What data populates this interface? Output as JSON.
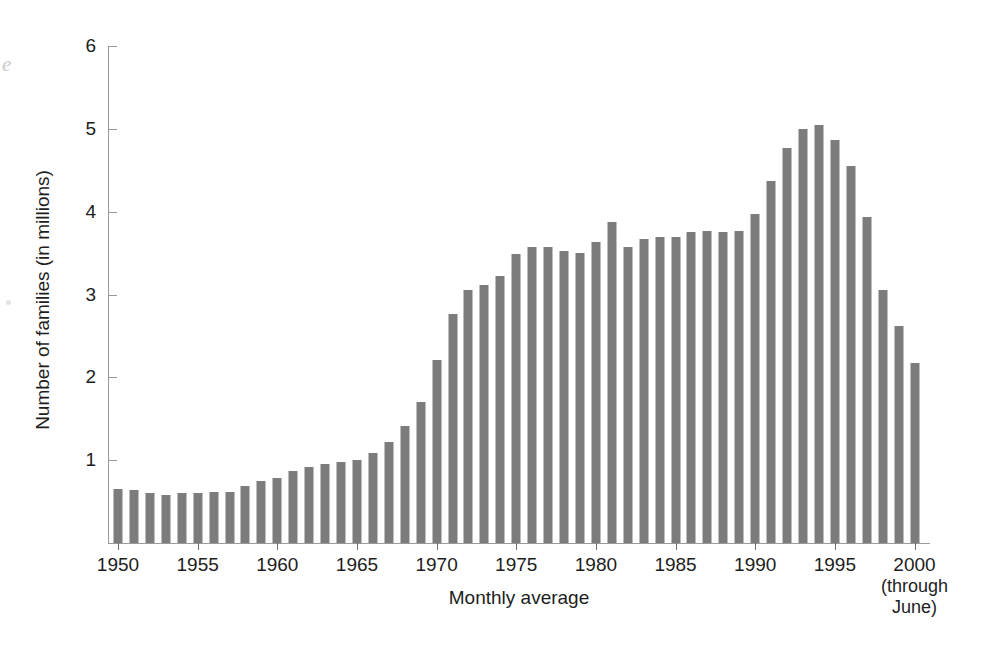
{
  "figure": {
    "margin_artifact": "e"
  },
  "chart_data": {
    "type": "bar",
    "title": "",
    "subtitle": "",
    "xlabel": "Monthly average",
    "ylabel": "Number of families (in millions)",
    "x_axis_note": {
      "year": "2000",
      "lines": [
        "(through",
        "June)"
      ]
    },
    "grid": false,
    "legend": "none",
    "bar_color": "#7c7c7c",
    "axis_color": "#9a9a9a",
    "ylim": [
      0,
      6
    ],
    "ytick_labels": [
      "6",
      "5",
      "4",
      "3",
      "2",
      "1"
    ],
    "yticks": [
      6,
      5,
      4,
      3,
      2,
      1
    ],
    "xlim": [
      1950,
      2000
    ],
    "xtick_labels": [
      "1950",
      "1955",
      "1960",
      "1965",
      "1970",
      "1975",
      "1980",
      "1985",
      "1990",
      "1995",
      "2000"
    ],
    "xticks": [
      1950,
      1955,
      1960,
      1965,
      1970,
      1975,
      1980,
      1985,
      1990,
      1995,
      2000
    ],
    "categories": [
      "1950",
      "1951",
      "1952",
      "1953",
      "1954",
      "1955",
      "1956",
      "1957",
      "1958",
      "1959",
      "1960",
      "1961",
      "1962",
      "1963",
      "1964",
      "1965",
      "1966",
      "1967",
      "1968",
      "1969",
      "1970",
      "1971",
      "1972",
      "1973",
      "1974",
      "1975",
      "1976",
      "1977",
      "1978",
      "1979",
      "1980",
      "1981",
      "1982",
      "1983",
      "1984",
      "1985",
      "1986",
      "1987",
      "1988",
      "1989",
      "1990",
      "1991",
      "1992",
      "1993",
      "1994",
      "1995",
      "1996",
      "1997",
      "1998",
      "1999",
      "2000"
    ],
    "values": [
      0.65,
      0.64,
      0.6,
      0.58,
      0.6,
      0.6,
      0.61,
      0.62,
      0.69,
      0.75,
      0.79,
      0.87,
      0.92,
      0.95,
      0.98,
      1.0,
      1.09,
      1.22,
      1.41,
      1.7,
      2.21,
      2.76,
      3.05,
      3.12,
      3.22,
      3.49,
      3.57,
      3.57,
      3.53,
      3.5,
      3.64,
      3.87,
      3.57,
      3.67,
      3.7,
      3.69,
      3.75,
      3.77,
      3.75,
      3.77,
      3.97,
      4.37,
      4.77,
      5.0,
      5.05,
      4.87,
      4.55,
      3.94,
      3.06,
      2.62,
      2.17
    ]
  }
}
